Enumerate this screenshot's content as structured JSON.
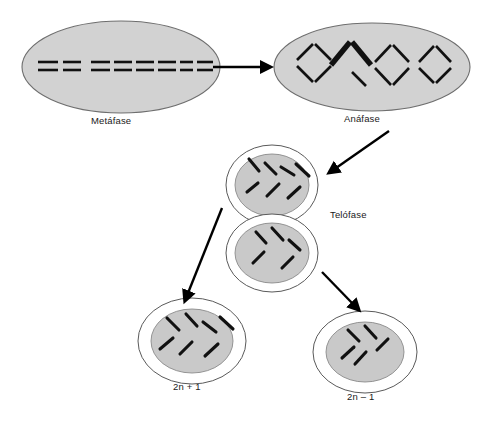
{
  "diagram": {
    "language": "es",
    "background_color": "#ffffff",
    "cell_fill_color": "#d2d2d2",
    "nucleus_fill_color": "#c9c9c9",
    "chromosome_color": "#111111",
    "outline_color": "#6e6e6e"
  },
  "labels": {
    "metaphase": "Metáfase",
    "anaphase": "Anáfase",
    "telophase": "Telófase",
    "daughter_trisomy": "2n + 1",
    "daughter_monosomy": "2n – 1"
  },
  "stages": [
    {
      "id": "metaphase",
      "label": "Metáfase",
      "shape": "ellipse",
      "chromosome_arrangement": "equatorial-plate",
      "chromosome_pair_count": 8,
      "description": "Cromosomas alineados en la placa ecuatorial como pares de barras horizontales"
    },
    {
      "id": "anaphase",
      "label": "Anáfase",
      "shape": "ellipse",
      "chromosome_arrangement": "separating-v-shapes",
      "chromosome_pair_count": 4,
      "nondisjunction_index": 1,
      "description": "Cuatro pares en forma de rombo; el segundo par aparece en negrita indicando no disyunción"
    },
    {
      "id": "telophase",
      "label": "Telófase",
      "shape": "figure-eight",
      "upper_cell_chromosomes": 7,
      "lower_cell_chromosomes": 5,
      "description": "Dos células hijas en formación; la superior recibe un cromosoma de más"
    },
    {
      "id": "daughter-trisomy",
      "label": "2n + 1",
      "shape": "circle",
      "chromosome_count": 7,
      "description": "Célula hija con un cromosoma adicional (trisomía)"
    },
    {
      "id": "daughter-monosomy",
      "label": "2n – 1",
      "shape": "circle",
      "chromosome_count": 5,
      "description": "Célula hija con un cromosoma de menos (monosomía)"
    }
  ],
  "arrows": [
    {
      "id": "metaphase-to-anaphase",
      "from": "metaphase",
      "to": "anaphase",
      "direction": "right"
    },
    {
      "id": "anaphase-to-telophase",
      "from": "anaphase",
      "to": "telophase",
      "direction": "down-left"
    },
    {
      "id": "telophase-to-trisomy",
      "from": "telophase",
      "to": "daughter-trisomy",
      "direction": "down-left"
    },
    {
      "id": "telophase-to-monosomy",
      "from": "telophase",
      "to": "daughter-monosomy",
      "direction": "down-right"
    }
  ]
}
